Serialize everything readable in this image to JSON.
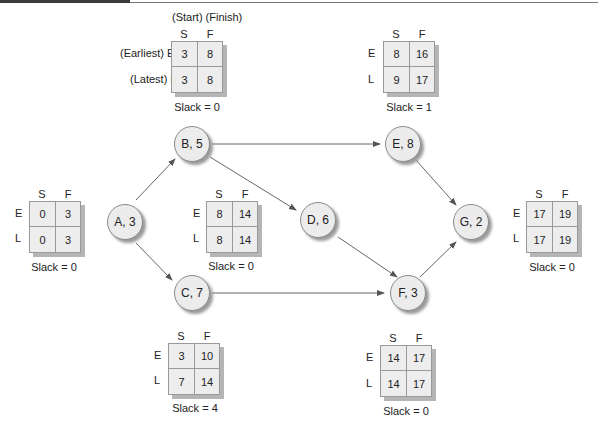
{
  "legend": {
    "top_label": "(Start) (Finish)",
    "earliest_label": "(Earliest)",
    "latest_label": "(Latest)"
  },
  "labels": {
    "S": "S",
    "F": "F",
    "E": "E",
    "L": "L"
  },
  "nodes": [
    {
      "id": "A",
      "label": "A, 3",
      "duration": 3
    },
    {
      "id": "B",
      "label": "B, 5",
      "duration": 5
    },
    {
      "id": "C",
      "label": "C, 7",
      "duration": 7
    },
    {
      "id": "D",
      "label": "D, 6",
      "duration": 6
    },
    {
      "id": "E",
      "label": "E, 8",
      "duration": 8
    },
    {
      "id": "F",
      "label": "F, 3",
      "duration": 3
    },
    {
      "id": "G",
      "label": "G, 2",
      "duration": 2
    }
  ],
  "edges": [
    [
      "A",
      "B"
    ],
    [
      "A",
      "C"
    ],
    [
      "B",
      "E"
    ],
    [
      "B",
      "D"
    ],
    [
      "C",
      "F"
    ],
    [
      "D",
      "F"
    ],
    [
      "E",
      "G"
    ],
    [
      "F",
      "G"
    ]
  ],
  "boxes": {
    "A": {
      "ES": "0",
      "EF": "3",
      "LS": "0",
      "LF": "3",
      "slack": "Slack = 0"
    },
    "B": {
      "ES": "3",
      "EF": "8",
      "LS": "3",
      "LF": "8",
      "slack": "Slack = 0"
    },
    "C": {
      "ES": "3",
      "EF": "10",
      "LS": "7",
      "LF": "14",
      "slack": "Slack = 4"
    },
    "D": {
      "ES": "8",
      "EF": "14",
      "LS": "8",
      "LF": "14",
      "slack": "Slack = 0"
    },
    "E": {
      "ES": "8",
      "EF": "16",
      "LS": "9",
      "LF": "17",
      "slack": "Slack = 1"
    },
    "F": {
      "ES": "14",
      "EF": "17",
      "LS": "14",
      "LF": "17",
      "slack": "Slack = 0"
    },
    "G": {
      "ES": "17",
      "EF": "19",
      "LS": "17",
      "LF": "19",
      "slack": "Slack = 0"
    }
  }
}
